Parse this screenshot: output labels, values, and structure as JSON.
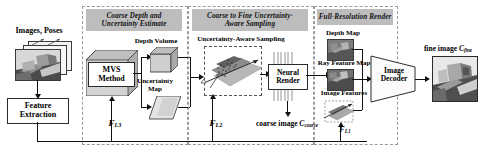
{
  "figure": {
    "accent_panel_header_bg": "#bdbdbd",
    "line_color": "#111111"
  },
  "input_stage": {
    "images_poses_label": "Images, Poses",
    "feature_extraction_label_line1": "Feature",
    "feature_extraction_label_line2": "Extraction"
  },
  "panels": [
    {
      "id": "coarse-depth",
      "title_line1": "Coarse Depth and",
      "title_line2": "Uncertainty Estimate"
    },
    {
      "id": "coarse-to-fine",
      "title_line1": "Coarse to Fine Uncertainty-",
      "title_line2": "Aware Sampling"
    },
    {
      "id": "full-res",
      "title_line1": "Full-Resolution Render",
      "title_line2": ""
    }
  ],
  "panel1": {
    "mvs_label_line1": "MVS",
    "mvs_label_line2": "Method",
    "depth_volume_label": "Depth Volume",
    "uncertainty_map_line1": "Uncertainty",
    "uncertainty_map_line2": "Map",
    "feature_label": "F",
    "feature_sub": "L3"
  },
  "panel2": {
    "sampling_label": "Uncertainty-Aware Sampling",
    "neural_render_line1": "Neural",
    "neural_render_line2": "Render",
    "coarse_image_label": "coarse image ",
    "coarse_image_symbol": "C",
    "coarse_image_sub": "coarse",
    "feature_label": "F",
    "feature_sub": "L2"
  },
  "panel3": {
    "depth_map_label": "Depth Map",
    "ray_feature_map_label": "Ray Feature Map",
    "image_features_label": "Image Features",
    "image_decoder_line1": "Image",
    "image_decoder_line2": "Decoder",
    "feature_label": "F",
    "feature_sub": "L1"
  },
  "output": {
    "fine_image_label": "fine image ",
    "fine_image_symbol": "C",
    "fine_image_sub": "fine"
  }
}
